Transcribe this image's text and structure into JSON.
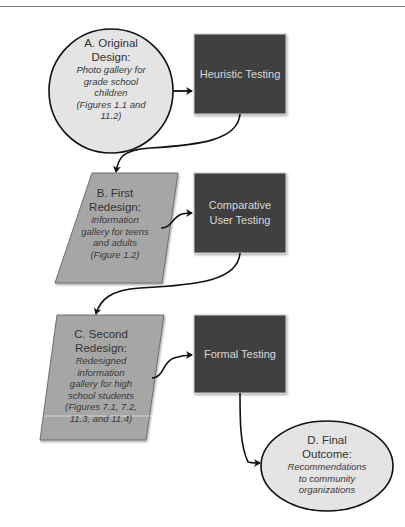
{
  "header": {
    "cropped_text": ""
  },
  "colors": {
    "ellipse_fill": "#e4e4e4",
    "parallelogram_fill": "#a6a6a6",
    "box_fill": "#3f3f3f",
    "box_text": "#d8d8d8",
    "connector": "#111111"
  },
  "nodes": {
    "a": {
      "title_line1": "A. Original",
      "title_line2": "Design:",
      "desc": [
        "Photo gallery for",
        "grade school",
        "children",
        "(Figures 1.1 and",
        "11.2)"
      ]
    },
    "heuristic": {
      "line1": "Heuristic Testing",
      "line2": ""
    },
    "b": {
      "title_line1": "B. First",
      "title_line2": "Redesign:",
      "desc": [
        "Information",
        "gallery for teens",
        "and adults",
        "(Figure 1.2)"
      ]
    },
    "comparative": {
      "line1": "Comparative",
      "line2": "User Testing"
    },
    "c": {
      "title_line1": "C. Second",
      "title_line2": "Redesign:",
      "desc": [
        "Redesigned",
        "information",
        "gallery for high",
        "school students",
        "(Figures 7.1, 7.2,",
        "11.3, and 11.4)"
      ]
    },
    "formal": {
      "line1": "Formal Testing",
      "line2": ""
    },
    "d": {
      "title_line1": "D. Final",
      "title_line2": "Outcome:",
      "desc": [
        "Recommendations",
        "to community",
        "organizations"
      ]
    }
  }
}
